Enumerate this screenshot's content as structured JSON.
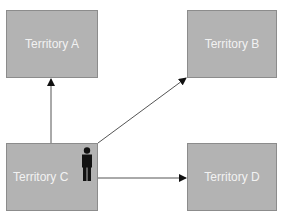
{
  "diagram": {
    "nodes": [
      {
        "id": "a",
        "label": "Territory A"
      },
      {
        "id": "b",
        "label": "Territory B"
      },
      {
        "id": "c",
        "label": "Territory C"
      },
      {
        "id": "d",
        "label": "Territory D"
      }
    ],
    "edges": [
      {
        "from": "c",
        "to": "a"
      },
      {
        "from": "c",
        "to": "b"
      },
      {
        "from": "c",
        "to": "d"
      }
    ],
    "icons": {
      "person": "person-icon"
    },
    "colors": {
      "box_fill": "#b3b3b3",
      "box_border": "#8c8c8c",
      "label": "#f2f2f2",
      "line": "#555555",
      "person": "#111111"
    }
  }
}
